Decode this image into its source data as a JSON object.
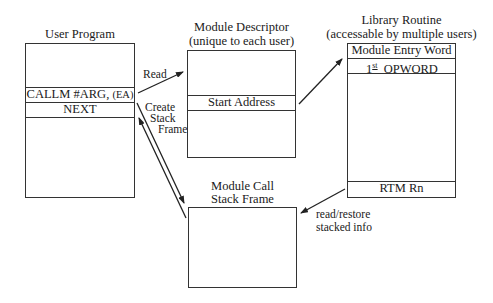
{
  "user_program": {
    "title": "User Program",
    "rows": {
      "callm": "CALLM #ARG,",
      "callm_ea": "(EA)",
      "next": "NEXT"
    }
  },
  "module_descriptor": {
    "title": "Module Descriptor",
    "subtitle": "(unique to each user)",
    "rows": {
      "start_address": "Start Address"
    }
  },
  "library_routine": {
    "title": "Library Routine",
    "subtitle": "(accessable by multiple users)",
    "rows": {
      "entry_word": "Module Entry Word",
      "opword_num": "1",
      "opword_sup": "st",
      "opword": "OPWORD",
      "rtm": "RTM Rn"
    }
  },
  "stack_frame": {
    "title_line1": "Module Call",
    "title_line2": "Stack Frame"
  },
  "arrows": {
    "read": "Read",
    "create_line1": "Create",
    "create_line2": "Stack",
    "create_line3": "Frame",
    "restore_line1": "read/restore",
    "restore_line2": "stacked info"
  },
  "colors": {
    "line": "#333333",
    "text": "#1a1a1a",
    "background": "#ffffff"
  }
}
